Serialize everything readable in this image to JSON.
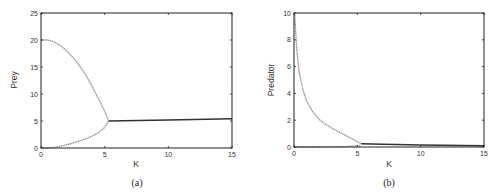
{
  "chart_data": [
    {
      "type": "scatter",
      "panel": "(a)",
      "xlabel": "K",
      "ylabel": "Prey",
      "xlim": [
        0,
        15
      ],
      "ylim": [
        0,
        25
      ],
      "xticks": [
        0,
        5,
        10,
        15
      ],
      "yticks": [
        0,
        5,
        10,
        15,
        20,
        25
      ],
      "grid": false,
      "series": [
        {
          "name": "upper branch (max)",
          "style": "gray dotted",
          "x": [
            0,
            0.5,
            1,
            1.5,
            2,
            2.5,
            3,
            3.5,
            4,
            4.5,
            5,
            5.3
          ],
          "y": [
            20,
            20,
            19.7,
            19,
            18,
            16.8,
            15.3,
            13.6,
            11.5,
            9.2,
            6.8,
            5.1
          ]
        },
        {
          "name": "lower branch (min)",
          "style": "gray dotted",
          "x": [
            0,
            0.5,
            1,
            1.5,
            2,
            2.5,
            3,
            3.5,
            4,
            4.5,
            5,
            5.3
          ],
          "y": [
            0,
            0,
            0.1,
            0.3,
            0.6,
            0.9,
            1.3,
            1.7,
            2.2,
            2.8,
            3.8,
            5.0
          ]
        },
        {
          "name": "stable equilibrium",
          "style": "black solid",
          "x": [
            5.3,
            10,
            15
          ],
          "y": [
            5.0,
            5.2,
            5.4
          ]
        }
      ]
    },
    {
      "type": "scatter",
      "panel": "(b)",
      "xlabel": "K",
      "ylabel": "Predator",
      "xlim": [
        0,
        15
      ],
      "ylim": [
        0,
        10
      ],
      "xticks": [
        0,
        5,
        10,
        15
      ],
      "yticks": [
        0,
        2,
        4,
        6,
        8,
        10
      ],
      "grid": false,
      "series": [
        {
          "name": "upper branch (max)",
          "style": "gray dotted",
          "x": [
            0.05,
            0.2,
            0.4,
            0.7,
            1,
            1.5,
            2,
            2.5,
            3,
            3.5,
            4,
            4.5,
            5,
            5.3
          ],
          "y": [
            10,
            7.5,
            5.6,
            4.3,
            3.4,
            2.6,
            2.05,
            1.7,
            1.4,
            1.15,
            0.9,
            0.65,
            0.4,
            0.25
          ]
        },
        {
          "name": "lower branch (min)",
          "style": "gray dotted",
          "x": [
            0,
            2,
            4,
            5.3
          ],
          "y": [
            0,
            0,
            0.02,
            0.1
          ]
        },
        {
          "name": "stable equilibrium",
          "style": "black solid",
          "x": [
            5.3,
            7,
            10,
            15
          ],
          "y": [
            0.25,
            0.2,
            0.15,
            0.1
          ]
        }
      ]
    }
  ],
  "panels": {
    "a": {
      "caption": "(a)",
      "xlabel": "K",
      "ylabel": "Prey",
      "xticks": [
        "0",
        "5",
        "10",
        "15"
      ],
      "yticks": [
        "0",
        "5",
        "10",
        "15",
        "20",
        "25"
      ]
    },
    "b": {
      "caption": "(b)",
      "xlabel": "K",
      "ylabel": "Predator",
      "xticks": [
        "0",
        "5",
        "10",
        "15"
      ],
      "yticks": [
        "0",
        "2",
        "4",
        "6",
        "8",
        "10"
      ]
    }
  },
  "colors": {
    "axis": "#222222",
    "branch": "#8a8a8a",
    "equilibrium": "#333333"
  }
}
